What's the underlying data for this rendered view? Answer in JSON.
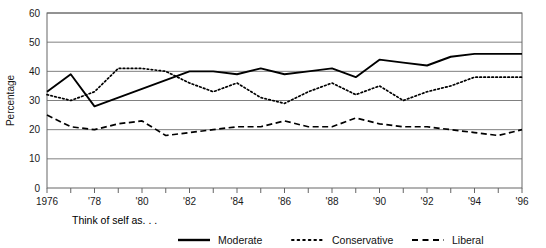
{
  "caption": {
    "prefix_label": "Think of self as. . ."
  },
  "axes": {
    "ylabel": "Percentage",
    "yticks": [
      "0",
      "10",
      "20",
      "30",
      "40",
      "50",
      "60"
    ],
    "xticks": [
      "1976",
      "'78",
      "'80",
      "'82",
      "'84",
      "'86",
      "'88",
      "'90",
      "'92",
      "'94",
      "'96"
    ]
  },
  "legend": {
    "position": "bottom",
    "entries": [
      {
        "label": "Moderate",
        "style": "solid"
      },
      {
        "label": "Conservative",
        "style": "dotted"
      },
      {
        "label": "Liberal",
        "style": "dashed"
      }
    ]
  },
  "colors": {
    "line": "#000000",
    "grid": "#808080",
    "frame": "#666666",
    "text": "#1a1a1a",
    "background": "#ffffff"
  },
  "chart_data": {
    "type": "line",
    "title": "",
    "xlabel": "",
    "ylabel": "Percentage",
    "ylim": [
      0,
      60
    ],
    "xlim": [
      1976,
      1996
    ],
    "grid": true,
    "legend_position": "bottom",
    "x": [
      1976,
      1977,
      1978,
      1979,
      1980,
      1981,
      1982,
      1983,
      1984,
      1985,
      1986,
      1987,
      1988,
      1989,
      1990,
      1991,
      1992,
      1993,
      1994,
      1995,
      1996
    ],
    "categories": [
      "1976",
      "1977",
      "1978",
      "1979",
      "1980",
      "1981",
      "1982",
      "1983",
      "1984",
      "1985",
      "1986",
      "1987",
      "1988",
      "1989",
      "1990",
      "1991",
      "1992",
      "1993",
      "1994",
      "1995",
      "1996"
    ],
    "series": [
      {
        "name": "Moderate",
        "style": "solid",
        "values": [
          33,
          39,
          28,
          31,
          34,
          37,
          40,
          40,
          39,
          41,
          39,
          40,
          41,
          38,
          44,
          43,
          42,
          45,
          46,
          46,
          46
        ]
      },
      {
        "name": "Conservative",
        "style": "dotted",
        "values": [
          32,
          30,
          33,
          41,
          41,
          40,
          36,
          33,
          36,
          31,
          29,
          33,
          36,
          32,
          35,
          30,
          33,
          35,
          38,
          38,
          38
        ]
      },
      {
        "name": "Liberal",
        "style": "dashed",
        "values": [
          25,
          21,
          20,
          22,
          23,
          18,
          19,
          20,
          21,
          21,
          23,
          21,
          21,
          24,
          22,
          21,
          21,
          20,
          19,
          18,
          20
        ]
      }
    ]
  }
}
